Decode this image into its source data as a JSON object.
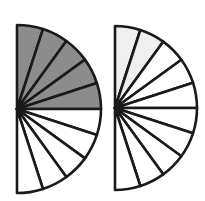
{
  "figures": [
    {
      "name": "left-semicircle",
      "cx": 17,
      "cy": 109,
      "r": 84,
      "sectors": 10,
      "shaded": 5,
      "shade_color": "#8c8c8c",
      "fraction_label": "5/10"
    },
    {
      "name": "right-semicircle",
      "cx": 115,
      "cy": 108,
      "r": 82,
      "sectors": 10,
      "shaded": 2,
      "shade_color": "#efefef",
      "fraction_label": "2/10"
    }
  ],
  "stroke_color": "#1a1a1a",
  "background": "#ffffff"
}
